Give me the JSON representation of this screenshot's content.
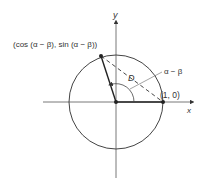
{
  "diagram": {
    "type": "unit-circle-distance",
    "labels": {
      "y_axis": "y",
      "x_axis": "x",
      "point_a": "(cos (α − β), sin (α − β))",
      "point_b": "(1, 0)",
      "distance": "D",
      "angle": "α − β"
    },
    "colors": {
      "stroke": "#333333",
      "background": "#ffffff"
    }
  }
}
